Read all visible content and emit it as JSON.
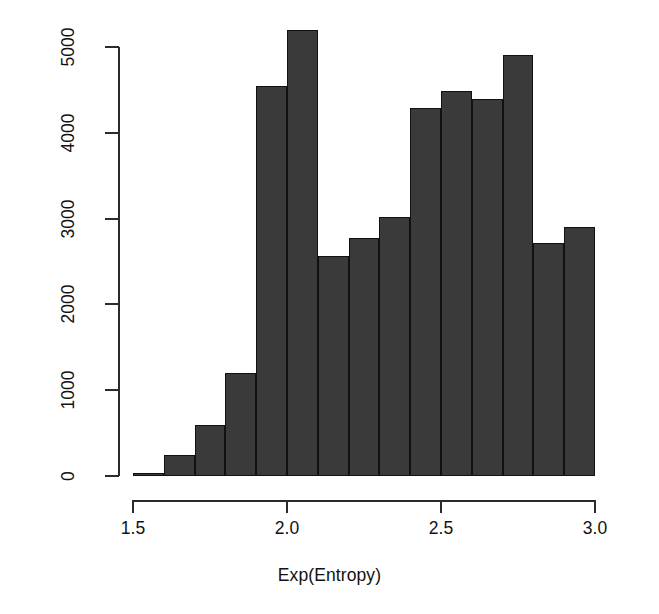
{
  "chart_data": {
    "type": "bar",
    "title": "",
    "subtitle": "",
    "xlabel": "Exp(Entropy)",
    "ylabel": "Number of Voters",
    "xlim": [
      1.5,
      3.0
    ],
    "ylim": [
      0,
      5000
    ],
    "grid": false,
    "legend": null,
    "x_ticks": [
      "1.5",
      "2.0",
      "2.5",
      "3.0"
    ],
    "x_tick_values": [
      1.5,
      2.0,
      2.5,
      3.0
    ],
    "y_ticks": [
      "0",
      "1000",
      "2000",
      "3000",
      "4000",
      "5000"
    ],
    "y_tick_values": [
      0,
      1000,
      2000,
      3000,
      4000,
      5000
    ],
    "bin_edges": [
      1.5,
      1.6,
      1.7,
      1.8,
      1.9,
      2.0,
      2.1,
      2.2,
      2.3,
      2.4,
      2.5,
      2.6,
      2.7,
      2.8,
      2.9,
      3.0
    ],
    "categories": [
      "1.5-1.6",
      "1.6-1.7",
      "1.7-1.8",
      "1.8-1.9",
      "1.9-2.0",
      "2.0-2.1",
      "2.1-2.2",
      "2.2-2.3",
      "2.3-2.4",
      "2.4-2.5",
      "2.5-2.6",
      "2.6-2.7",
      "2.7-2.8",
      "2.8-2.9",
      "2.9-3.0"
    ],
    "values": [
      30,
      240,
      600,
      1200,
      4550,
      5200,
      2560,
      2770,
      3020,
      4290,
      4490,
      4390,
      4910,
      2720,
      2900
    ],
    "bar_color": "#3a3a3a",
    "bar_border_color": "#111111",
    "background_color": "#ffffff"
  },
  "axes": {
    "y_title": "Number of Voters",
    "x_title": "Exp(Entropy)"
  }
}
